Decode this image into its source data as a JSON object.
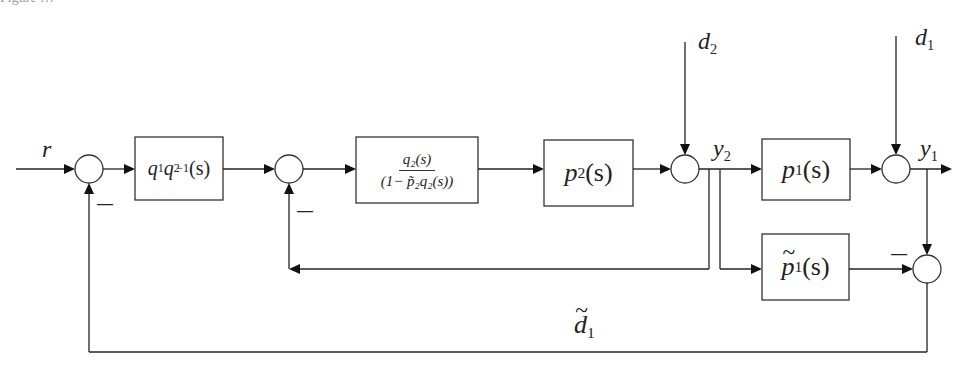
{
  "caption_fragment": "Figure …",
  "signals": {
    "reference": "r",
    "disturbance_2": {
      "base": "d",
      "sub": "2"
    },
    "disturbance_1": {
      "base": "d",
      "sub": "1"
    },
    "output_2": {
      "base": "y",
      "sub": "2"
    },
    "output_1": {
      "base": "y",
      "sub": "1"
    },
    "estimated_disturbance": {
      "base": "d",
      "sub": "1",
      "tilde": true
    }
  },
  "blocks": {
    "setpoint_filter": {
      "q1": "q",
      "q1_sub": "1",
      "q2": "q",
      "q2_sub": "2",
      "q2_sup": "−1",
      "arg": "(s)"
    },
    "inner_controller": {
      "numerator": "q₂(s)",
      "denominator": "(1− p̃₂q₂(s))"
    },
    "inner_plant": {
      "base": "p",
      "sub": "2",
      "arg": "(s)"
    },
    "outer_plant": {
      "base": "p",
      "sub": "1",
      "arg": "(s)"
    },
    "outer_model": {
      "base": "p",
      "sub": "1",
      "arg": "(s)",
      "tilde": true
    }
  },
  "signs": {
    "sum1_feedback": "—",
    "sum2_feedback": "—",
    "sum5_model": "—"
  },
  "colors": {
    "line": "#222222",
    "background": "#ffffff"
  }
}
